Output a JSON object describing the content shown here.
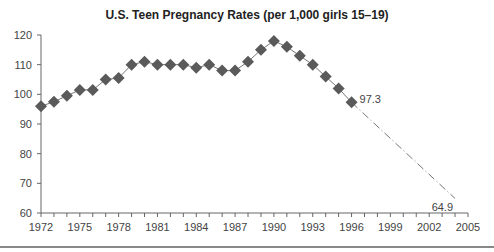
{
  "chart_data": {
    "type": "line",
    "title": "U.S. Teen Pregnancy Rates (per 1,000 girls 15–19)",
    "xlabel": "",
    "ylabel": "",
    "xlim": [
      1972,
      2005
    ],
    "ylim": [
      60,
      120
    ],
    "yticks": [
      60,
      70,
      80,
      90,
      100,
      110,
      120
    ],
    "xticks": [
      1972,
      1975,
      1978,
      1981,
      1984,
      1987,
      1990,
      1993,
      1996,
      1999,
      2002,
      2005
    ],
    "grid": false,
    "legend": null,
    "series": [
      {
        "name": "Observed",
        "style": "solid line with diamond markers",
        "x": [
          1972,
          1973,
          1974,
          1975,
          1976,
          1977,
          1978,
          1979,
          1980,
          1981,
          1982,
          1983,
          1984,
          1985,
          1986,
          1987,
          1988,
          1989,
          1990,
          1991,
          1992,
          1993,
          1994,
          1995,
          1996
        ],
        "values": [
          96,
          97.5,
          99.5,
          101.5,
          101.5,
          105,
          105.5,
          110,
          111,
          110,
          110,
          110,
          109,
          110,
          108,
          108,
          111,
          115,
          118,
          116,
          113,
          110,
          106,
          102,
          97.3
        ]
      },
      {
        "name": "Projection",
        "style": "dash-dot line",
        "x": [
          1996,
          2004
        ],
        "values": [
          97.3,
          64.9
        ]
      }
    ],
    "annotations": [
      {
        "x": 1996,
        "y": 97.3,
        "text": "97.3"
      },
      {
        "x": 2004,
        "y": 64.9,
        "text": "64.9"
      }
    ]
  },
  "colors": {
    "marker": "#5a5a5a",
    "line": "#777777",
    "axis": "#666666"
  }
}
